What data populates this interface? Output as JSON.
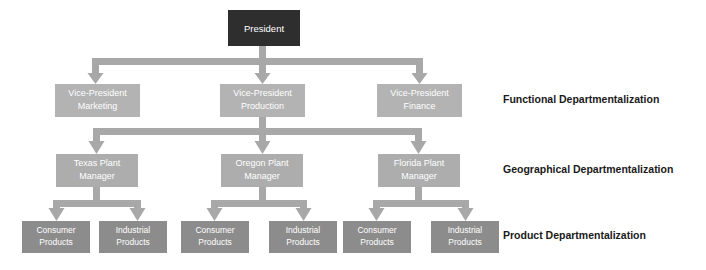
{
  "diagram": {
    "canvas": {
      "width": 706,
      "height": 270,
      "background": "#ffffff"
    },
    "colors": {
      "president_fill": "#2e2e2e",
      "president_text": "#ffffff",
      "level2_fill": "#b3b3b3",
      "level2_text": "#ffffff",
      "level3_fill": "#adadad",
      "level3_text": "#ffffff",
      "level4_fill": "#8c8c8c",
      "level4_text": "#ffffff",
      "connector": "#a8a8a8",
      "tier_label_text": "#1a1a1a"
    },
    "levels": [
      {
        "id": "level-1",
        "name": "executive",
        "tier_label": "",
        "nodes": [
          {
            "id": "president",
            "lines": [
              "President"
            ]
          }
        ]
      },
      {
        "id": "level-2",
        "name": "functional",
        "tier_label": "Functional Departmentalization",
        "nodes": [
          {
            "id": "vp-marketing",
            "lines": [
              "Vice-President",
              "Marketing"
            ]
          },
          {
            "id": "vp-production",
            "lines": [
              "Vice-President",
              "Production"
            ]
          },
          {
            "id": "vp-finance",
            "lines": [
              "Vice-President",
              "Finance"
            ]
          }
        ]
      },
      {
        "id": "level-3",
        "name": "geographical",
        "tier_label": "Geographical Departmentalization",
        "nodes": [
          {
            "id": "texas-plant",
            "lines": [
              "Texas Plant",
              "Manager"
            ]
          },
          {
            "id": "oregon-plant",
            "lines": [
              "Oregon Plant",
              "Manager"
            ]
          },
          {
            "id": "florida-plant",
            "lines": [
              "Florida Plant",
              "Manager"
            ]
          }
        ]
      },
      {
        "id": "level-4",
        "name": "product",
        "tier_label": "Product Departmentalization",
        "nodes": [
          {
            "id": "texas-consumer",
            "lines": [
              "Consumer",
              "Products"
            ]
          },
          {
            "id": "texas-industrial",
            "lines": [
              "Industrial",
              "Products"
            ]
          },
          {
            "id": "oregon-consumer",
            "lines": [
              "Consumer",
              "Products"
            ]
          },
          {
            "id": "oregon-industrial",
            "lines": [
              "Industrial",
              "Products"
            ]
          },
          {
            "id": "florida-consumer",
            "lines": [
              "Consumer",
              "Products"
            ]
          },
          {
            "id": "florida-industrial",
            "lines": [
              "Industrial",
              "Products"
            ]
          }
        ]
      }
    ],
    "tier_labels": [
      {
        "id": "tier-label-functional",
        "text": "Functional Departmentalization"
      },
      {
        "id": "tier-label-geographical",
        "text": "Geographical Departmentalization"
      },
      {
        "id": "tier-label-product",
        "text": "Product Departmentalization"
      }
    ]
  }
}
